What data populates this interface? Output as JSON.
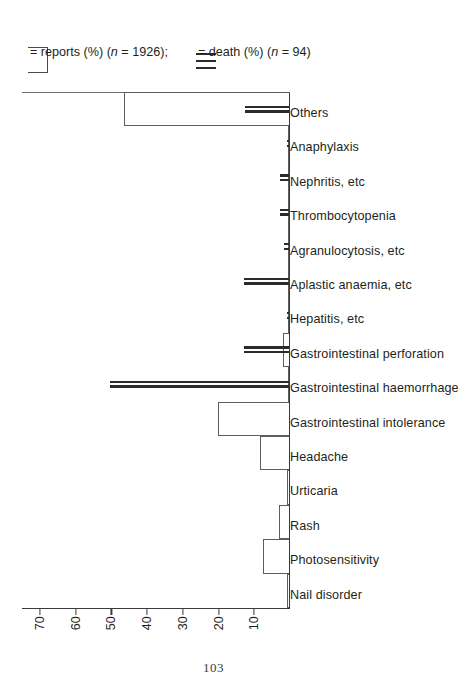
{
  "page": {
    "folio": "103"
  },
  "chart_data": {
    "type": "bar",
    "title": "",
    "subtitle": "",
    "xlabel": "",
    "ylabel": "",
    "ylim": [
      0,
      75
    ],
    "yticks": [
      10,
      20,
      30,
      40,
      50,
      60,
      70
    ],
    "grid": false,
    "legend_position": "right",
    "categories": [
      "Nail disorder",
      "Photosensitivity",
      "Rash",
      "Urticaria",
      "Headache",
      "Gastrointestinal intolerance",
      "Gastrointestinal haemorrhage",
      "Gastrointestinal perforation",
      "Hepatitis, etc",
      "Aplastic anaemia, etc",
      "Agranulocytosis, etc",
      "Thrombocytopenia",
      "Nephritis, etc",
      "Anaphylaxis",
      "Others"
    ],
    "series": [
      {
        "name": "reports (%) (n = 1926)",
        "style": "open-bar",
        "values": [
          0.6,
          7.2,
          2.8,
          0.5,
          8.0,
          20.0,
          0.4,
          1.6,
          0.3,
          0.3,
          0.3,
          0.3,
          0.3,
          0.3,
          46.2
        ]
      },
      {
        "name": "death (%) (n = 94)",
        "style": "solid-line",
        "values": [
          0,
          0,
          0,
          0,
          0,
          0,
          50.0,
          12.5,
          0.6,
          12.6,
          1.4,
          2.6,
          2.6,
          0.6,
          12.4
        ]
      }
    ],
    "legend": [
      {
        "key": "open-bar",
        "label": "= reports (%) (",
        "italic": "n",
        "label_tail": " = 1926);"
      },
      {
        "key": "solid-line",
        "label": "= death (%) (",
        "italic": "n",
        "label_tail": " = 94)"
      }
    ]
  }
}
